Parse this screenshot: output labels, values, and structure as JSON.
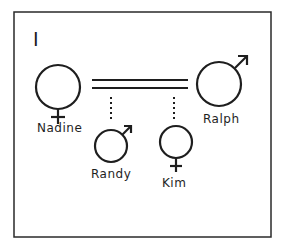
{
  "figure": {
    "panel_label": "I",
    "type": "genogram",
    "relationship": "married (double line)",
    "people": [
      {
        "name": "Nadine",
        "sex": "female",
        "symbol": "venus-icon",
        "role": "parent"
      },
      {
        "name": "Ralph",
        "sex": "male",
        "symbol": "mars-icon",
        "role": "parent"
      },
      {
        "name": "Randy",
        "sex": "male",
        "symbol": "mars-icon",
        "role": "child"
      },
      {
        "name": "Kim",
        "sex": "female",
        "symbol": "venus-icon",
        "role": "child"
      }
    ]
  },
  "colors": {
    "stroke": "#1e1e1e",
    "background": "#ffffff"
  }
}
